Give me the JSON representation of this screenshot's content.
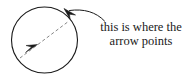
{
  "figure": {
    "background_color": "#ffffff",
    "stroke_color": "#1a1a1a",
    "dash_color": "#555555",
    "width": 187,
    "height": 78
  },
  "circle": {
    "name": "circle-outline",
    "center_x": 44.5,
    "center_y": 40,
    "radius": 33,
    "stroke_color": "#1a1a1a",
    "stroke_width": 1,
    "fill": "none"
  },
  "inner_arrow": {
    "name": "dashed-diagonal-arrow",
    "style": "dashed",
    "start_x": 21,
    "start_y": 57,
    "end_x": 68,
    "end_y": 22,
    "stroke_color": "#6a6a6a",
    "arrowhead_x": 33,
    "arrowhead_y": 48,
    "arrowhead_direction": "up-right"
  },
  "pointer_arrow": {
    "name": "circumference-pointer-arrowhead",
    "tip_x": 65,
    "tip_y": 9,
    "direction": "up-left",
    "fill_color": "#1a1a1a"
  },
  "leader": {
    "name": "curved-leader-line",
    "from_x": 68,
    "from_y": 10,
    "to_x": 104,
    "to_y": 21,
    "stroke_color": "#1a1a1a",
    "curved": true
  },
  "annotation": {
    "name": "annotation-label",
    "lines": [
      "this is where the",
      "arrow points"
    ],
    "line1": "this is where the",
    "line2": "arrow points",
    "text_color": "#1a1a1a",
    "align": "center"
  }
}
